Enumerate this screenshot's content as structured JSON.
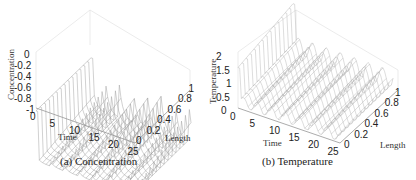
{
  "chart_data": [
    {
      "type": "surface",
      "caption": "(a) Concentration",
      "title": "",
      "xlabel": "Time",
      "ylabel": "Length",
      "zlabel": "Concentration",
      "x_ticks": [
        "0",
        "5",
        "10",
        "15",
        "20",
        "25"
      ],
      "y_ticks": [
        "0",
        "0.2",
        "0.4",
        "0.6",
        "0.8",
        "1"
      ],
      "z_ticks": [
        "0",
        "-0.2",
        "-0.4",
        "-0.6",
        "-0.8",
        "-1"
      ],
      "xlim": [
        0,
        25
      ],
      "ylim": [
        0,
        1
      ],
      "zlim": [
        -1,
        0
      ],
      "grid": true,
      "description": "Wireframe mesh; concentration starts near 0 at t=0, drops to about -0.9, then shows periodic pulses (~every 3.5 time units) rising toward about -0.3 along Length",
      "peaks_time": [
        0,
        3.5,
        7,
        10.5,
        14,
        17.5,
        21,
        24.5
      ]
    },
    {
      "type": "surface",
      "caption": "(b) Temperature",
      "title": "",
      "xlabel": "Time",
      "ylabel": "Length",
      "zlabel": "Temperature",
      "x_ticks": [
        "0",
        "5",
        "10",
        "15",
        "20",
        "25"
      ],
      "y_ticks": [
        "0",
        "0.2",
        "0.4",
        "0.6",
        "0.8",
        "1"
      ],
      "z_ticks": [
        "0",
        "0.5",
        "1",
        "1.5",
        "2"
      ],
      "xlim": [
        0,
        25
      ],
      "ylim": [
        0,
        1
      ],
      "zlim": [
        0,
        2
      ],
      "grid": true,
      "description": "Wireframe mesh; temperature rises to about 1.9 at t=0, then periodic humps (~every 3.5 time units) of height about 0.5-0.7 across Length",
      "peaks_time": [
        0,
        3.5,
        7,
        10.5,
        14,
        17.5,
        21,
        24.5
      ]
    }
  ]
}
